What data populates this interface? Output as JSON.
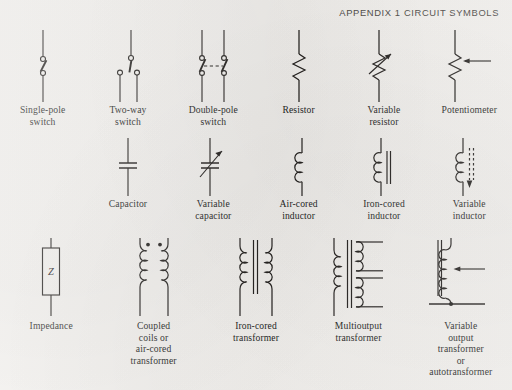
{
  "header": {
    "title": "APPENDIX 1 CIRCUIT SYMBOLS"
  },
  "page": {
    "background_color": "#f2f0ed",
    "ink_color": "#23201e"
  },
  "symbol_rows": [
    {
      "row": 1,
      "symbols": [
        {
          "name": "single-pole-switch",
          "caption": "Single-pole\nswitch"
        },
        {
          "name": "two-way-switch",
          "caption": "Two-way\nswitch"
        },
        {
          "name": "double-pole-switch",
          "caption": "Double-pole\nswitch"
        },
        {
          "name": "resistor",
          "caption": "Resistor"
        },
        {
          "name": "variable-resistor",
          "caption": "Variable\nresistor"
        },
        {
          "name": "potentiometer",
          "caption": "Potentiometer"
        }
      ]
    },
    {
      "row": 2,
      "symbols": [
        {
          "name": "capacitor",
          "caption": "Capacitor"
        },
        {
          "name": "variable-capacitor",
          "caption": "Variable\ncapacitor"
        },
        {
          "name": "air-cored-inductor",
          "caption": "Air-cored\ninductor"
        },
        {
          "name": "iron-cored-inductor",
          "caption": "Iron-cored\ninductor"
        },
        {
          "name": "variable-inductor",
          "caption": "Variable\ninductor"
        }
      ]
    },
    {
      "row": 3,
      "symbols": [
        {
          "name": "impedance",
          "caption": "Impedance",
          "label": "Z"
        },
        {
          "name": "coupled-coils-air-cored-transformer",
          "caption": "Coupled\ncoils or\nair-cored\ntransformer"
        },
        {
          "name": "iron-cored-transformer",
          "caption": "Iron-cored\ntransformer"
        },
        {
          "name": "multioutput-transformer",
          "caption": "Multioutput\ntransformer"
        },
        {
          "name": "variable-output-transformer-autotransformer",
          "caption": "Variable\noutput\ntransformer\nor\nautotransformer"
        }
      ]
    }
  ]
}
